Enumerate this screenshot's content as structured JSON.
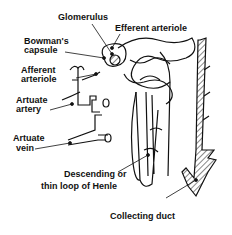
{
  "diagram": {
    "labels": {
      "glomerulus": "Glomerulus",
      "efferent_arteriole": "Efferent arteriole",
      "bowmans_capsule_1": "Bowman's",
      "bowmans_capsule_2": "capsule",
      "afferent_arteriole_1": "Afferent",
      "afferent_arteriole_2": "arteriole",
      "artuate_artery_1": "Artuate",
      "artuate_artery_2": "artery",
      "artuate_vein_1": "Artuate",
      "artuate_vein_2": "vein",
      "loop_henle_1": "Descending or",
      "loop_henle_2": "thin loop of Henle",
      "collecting_duct": "Collecting duct"
    },
    "colors": {
      "ink": "#111111",
      "background": "#ffffff"
    }
  }
}
